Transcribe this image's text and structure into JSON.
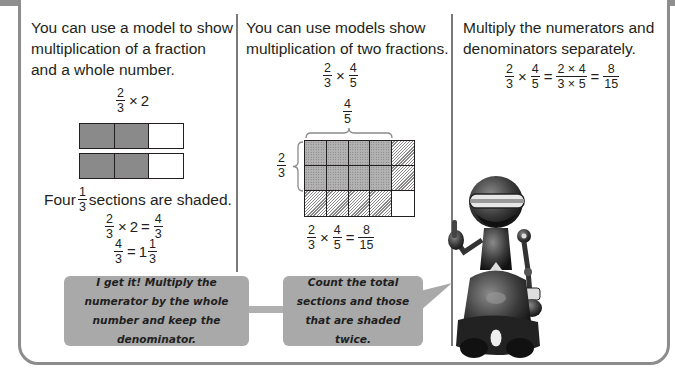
{
  "col1": {
    "intro": "You can use a model to show multiplication of a fraction and a whole number.",
    "expression": {
      "num": "2",
      "den": "3",
      "op": "×",
      "whole": "2"
    },
    "model": {
      "bars": [
        {
          "segments": [
            "shaded",
            "shaded",
            "plain"
          ]
        },
        {
          "segments": [
            "shaded",
            "shaded",
            "plain"
          ]
        }
      ]
    },
    "caption": {
      "before": "Four",
      "frac_num": "1",
      "frac_den": "3",
      "after": "sections are shaded."
    },
    "eq1": {
      "a_num": "2",
      "a_den": "3",
      "op": "×",
      "b": "2",
      "eq": "=",
      "r_num": "4",
      "r_den": "3"
    },
    "eq2": {
      "a_num": "4",
      "a_den": "3",
      "eq": "=",
      "whole": "1",
      "r_num": "1",
      "r_den": "3"
    }
  },
  "col2": {
    "intro": "You can use models show multiplication of two fractions.",
    "expression": {
      "a_num": "2",
      "a_den": "3",
      "op": "×",
      "b_num": "4",
      "b_den": "5"
    },
    "top_label": {
      "num": "4",
      "den": "5"
    },
    "side_label": {
      "num": "2",
      "den": "3"
    },
    "grid": {
      "rows": 3,
      "cols": 5,
      "cells": [
        [
          "both",
          "both",
          "both",
          "both",
          "hatch"
        ],
        [
          "both",
          "both",
          "both",
          "both",
          "hatch"
        ],
        [
          "hatch",
          "hatch",
          "hatch",
          "hatch",
          "none"
        ]
      ]
    },
    "result": {
      "a_num": "2",
      "a_den": "3",
      "op": "×",
      "b_num": "4",
      "b_den": "5",
      "eq": "=",
      "r_num": "8",
      "r_den": "15"
    }
  },
  "col3": {
    "intro": "Multiply the numerators and denominators separately.",
    "equation": {
      "a_num": "2",
      "a_den": "3",
      "op": "×",
      "b_num": "4",
      "b_den": "5",
      "eq1": "=",
      "m_num": "2 × 4",
      "m_den": "3 × 5",
      "eq2": "=",
      "r_num": "8",
      "r_den": "15"
    }
  },
  "bubbles": {
    "left": "I get it! Multiply the numerator by the whole number and keep the denominator.",
    "right": "Count the total sections and those that are shaded twice."
  },
  "colors": {
    "frame": "#8c8c8c",
    "bubble": "#a9a9a9",
    "shaded": "#8a8a8a",
    "text": "#231f20"
  }
}
